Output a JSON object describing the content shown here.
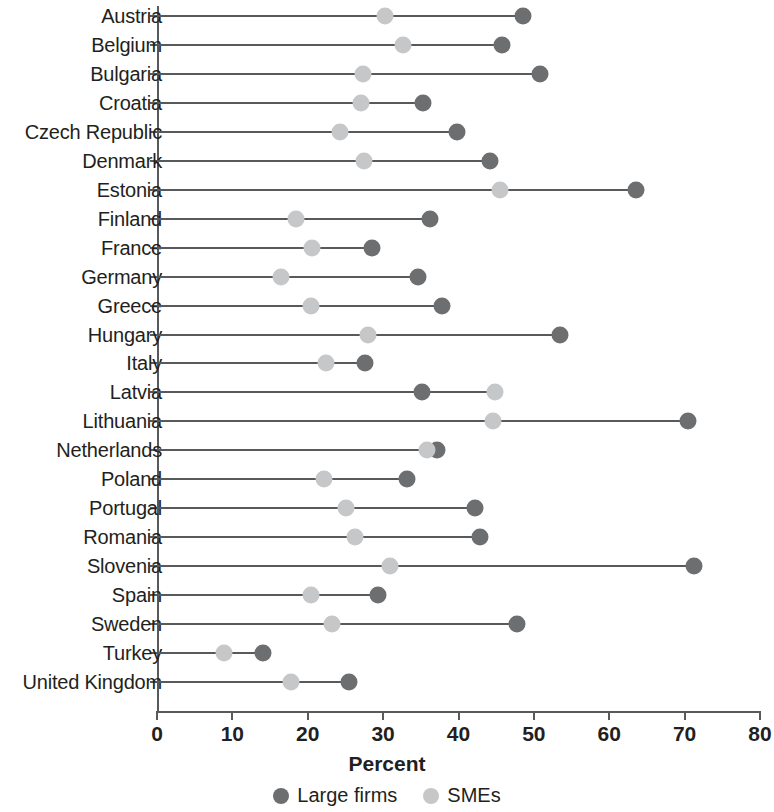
{
  "chart_data": {
    "type": "scatter",
    "subtype": "dumbbell",
    "title": "",
    "xlabel": "Percent",
    "ylabel": "",
    "xlim": [
      0,
      80
    ],
    "xticks": [
      0,
      10,
      20,
      30,
      40,
      50,
      60,
      70,
      80
    ],
    "xtick_labels": [
      "0",
      "10",
      "20",
      "30",
      "40",
      "50",
      "60",
      "70",
      "80"
    ],
    "grid": false,
    "legend_position": "bottom",
    "legend": [
      {
        "name": "Large firms",
        "color": "#6d6e70"
      },
      {
        "name": "SMEs",
        "color": "#c6c7c9"
      }
    ],
    "categories": [
      "Austria",
      "Belgium",
      "Bulgaria",
      "Croatia",
      "Czech Republic",
      "Denmark",
      "Estonia",
      "Finland",
      "France",
      "Germany",
      "Greece",
      "Hungary",
      "Italy",
      "Latvia",
      "Lithuania",
      "Netherlands",
      "Poland",
      "Portugal",
      "Romania",
      "Slovenia",
      "Spain",
      "Sweden",
      "Turkey",
      "United Kingdom"
    ],
    "series": [
      {
        "name": "Large firms",
        "color": "#6d6e70",
        "values": [
          48.5,
          45.8,
          50.8,
          35.3,
          39.8,
          44.2,
          63.5,
          36.2,
          28.5,
          34.6,
          37.8,
          53.4,
          27.6,
          35.1,
          70.4,
          37.1,
          33.2,
          42.2,
          42.8,
          71.3,
          29.3,
          47.7,
          14.0,
          25.5
        ]
      },
      {
        "name": "SMEs",
        "color": "#c6c7c9",
        "values": [
          30.2,
          32.6,
          27.3,
          27.0,
          24.3,
          27.5,
          45.5,
          18.4,
          20.6,
          16.4,
          20.4,
          28.0,
          22.4,
          44.8,
          44.6,
          35.8,
          22.1,
          25.1,
          26.3,
          30.9,
          20.4,
          23.2,
          8.9,
          17.8
        ]
      }
    ]
  }
}
